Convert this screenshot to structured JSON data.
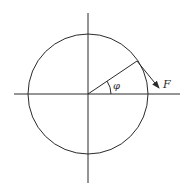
{
  "diagram": {
    "type": "circle-force-diagram",
    "canvas": {
      "width": 187,
      "height": 190,
      "background": "#ffffff"
    },
    "stroke_color": "#2a2a2a",
    "center": {
      "x": 88,
      "y": 94
    },
    "circle": {
      "radius": 60
    },
    "axes": {
      "horizontal": {
        "x1": 14,
        "x2": 180,
        "y": 94
      },
      "vertical": {
        "x": 88,
        "y1": 13,
        "y2": 183
      }
    },
    "radius_line": {
      "x1": 88,
      "y1": 94,
      "x2": 137,
      "y2": 61
    },
    "force_arrow": {
      "x1": 137,
      "y1": 61,
      "x2": 159,
      "y2": 88
    },
    "angle_arc": {
      "radius": 23
    },
    "labels": {
      "angle": "φ",
      "force": "F"
    }
  }
}
